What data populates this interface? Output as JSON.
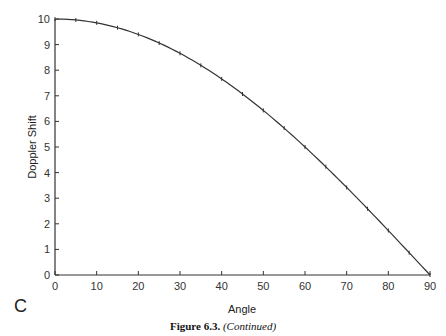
{
  "chart_data": {
    "type": "line",
    "title": "",
    "xlabel": "Angle",
    "ylabel": "Doppler Shift",
    "xlim": [
      0,
      90
    ],
    "ylim": [
      0,
      10
    ],
    "x_ticks": [
      0,
      10,
      20,
      30,
      40,
      50,
      60,
      70,
      80,
      90
    ],
    "y_ticks": [
      0,
      1,
      2,
      3,
      4,
      5,
      6,
      7,
      8,
      9,
      10
    ],
    "grid": false,
    "legend": null,
    "series": [
      {
        "name": "Doppler Shift",
        "x": [
          0,
          5,
          10,
          15,
          20,
          25,
          30,
          35,
          40,
          45,
          50,
          55,
          60,
          65,
          70,
          75,
          80,
          85,
          90
        ],
        "values": [
          10.0,
          9.96,
          9.85,
          9.66,
          9.4,
          9.06,
          8.66,
          8.19,
          7.66,
          7.07,
          6.43,
          5.74,
          5.0,
          4.23,
          3.42,
          2.59,
          1.74,
          0.87,
          0.0
        ]
      }
    ]
  },
  "panel_label": "C",
  "caption": {
    "figure": "Figure 6.3.",
    "note": "(Continued)"
  }
}
